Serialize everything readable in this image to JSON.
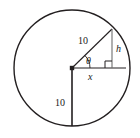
{
  "figure": {
    "background_color": "#ffffff",
    "stroke_color": "#231f20",
    "label_color": "#1a1a1a",
    "circle": {
      "center_x": 72,
      "center_y": 68,
      "radius": 58
    },
    "labels": {
      "hypotenuse_radius": "10",
      "vertical_radius": "10",
      "height_segment": "h",
      "base_segment": "x",
      "angle": "θ"
    },
    "segments": {
      "slant_radius_label": "10",
      "down_radius_label": "10",
      "height_label": "h",
      "base_label": "x"
    },
    "markers": {
      "right_angle": "right-angle-square",
      "vertex_dot": "center-point"
    }
  }
}
